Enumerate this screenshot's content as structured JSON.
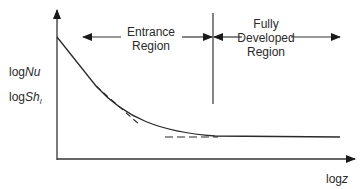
{
  "diagram": {
    "type": "schematic plot",
    "y_axis_labels": {
      "line1_prefix": "log",
      "line1_var": "Nu",
      "line2_prefix": "log",
      "line2_var": "Sh",
      "line2_sub": "l"
    },
    "x_axis_label": {
      "prefix": "log",
      "var": "z"
    },
    "regions": {
      "entrance": {
        "line1": "Entrance",
        "line2": "Region"
      },
      "fully_developed": {
        "line1": "Fully",
        "line2": "Developed",
        "line3": "Region"
      }
    },
    "curves": [
      {
        "name": "Nu/Sh curve",
        "style": "solid",
        "description": "decreasing from high value at small z, asymptoting to constant in fully developed region"
      },
      {
        "name": "entrance asymptote",
        "style": "dashed",
        "description": "straight line tangent to curve at small z"
      },
      {
        "name": "fully developed asymptote",
        "style": "dashed",
        "description": "horizontal line at constant value"
      }
    ],
    "colors": {
      "line": "#2a2a2a",
      "background": "#ffffff"
    }
  }
}
